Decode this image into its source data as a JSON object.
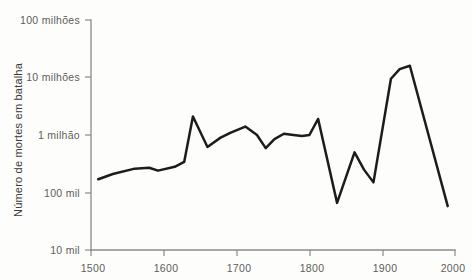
{
  "chart_data": {
    "type": "line",
    "title": "",
    "subtitle": "",
    "xlabel": "",
    "ylabel": "Número de mortes em batalha",
    "yscale": "log",
    "xlim": [
      1500,
      2000
    ],
    "ylim": [
      10000,
      100000000
    ],
    "grid": false,
    "legend": null,
    "xticks": [
      1500,
      1600,
      1700,
      1800,
      1900,
      2000
    ],
    "xticklabels": [
      "1500",
      "1600",
      "1700",
      "1800",
      "1900",
      "2000"
    ],
    "yticks": [
      10000,
      100000,
      1000000,
      10000000,
      100000000
    ],
    "yticklabels": [
      "10 mil",
      "100 mil",
      "1 milhão",
      "10 milhões",
      "100 milhões"
    ],
    "line_color": "#1c1c1a",
    "axis_color": "#8a8a86",
    "series": [
      {
        "name": "Mortes em batalha",
        "x": [
          1510,
          1530,
          1560,
          1580,
          1592,
          1615,
          1628,
          1640,
          1660,
          1678,
          1692,
          1712,
          1728,
          1740,
          1752,
          1765,
          1778,
          1790,
          1800,
          1812,
          1838,
          1862,
          1875,
          1888,
          1912,
          1924,
          1938,
          1990
        ],
        "values": [
          170000,
          210000,
          260000,
          270000,
          240000,
          280000,
          340000,
          2100000,
          620000,
          900000,
          1100000,
          1400000,
          1000000,
          590000,
          850000,
          1050000,
          1000000,
          960000,
          1000000,
          1900000,
          66000,
          500000,
          250000,
          150000,
          9500000,
          14000000,
          16000000,
          58000
        ]
      }
    ]
  },
  "axes": {
    "y_title": "Número de mortes em batalha"
  }
}
